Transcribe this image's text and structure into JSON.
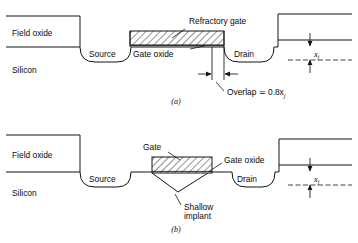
{
  "figure": {
    "background_color": "#ffffff",
    "line_color": "#141414"
  },
  "panel_a": {
    "id": "(a)",
    "labels": {
      "field_oxide": "Field oxide",
      "silicon": "Silicon",
      "source": "Source",
      "drain": "Drain",
      "gate": "Refractory gate",
      "gate_oxide": "Gate oxide",
      "overlap": "Overlap ≃ 0.8x",
      "overlap_sub": "j",
      "xj": "x",
      "xj_sub": "j"
    }
  },
  "panel_b": {
    "id": "(b)",
    "labels": {
      "field_oxide": "Field oxide",
      "silicon": "Silicon",
      "source": "Source",
      "drain": "Drain",
      "gate": "Gate",
      "gate_oxide": "Gate oxide",
      "implant_line1": "Shallow",
      "implant_line2": "implant",
      "xj": "x",
      "xj_sub": "j"
    }
  }
}
